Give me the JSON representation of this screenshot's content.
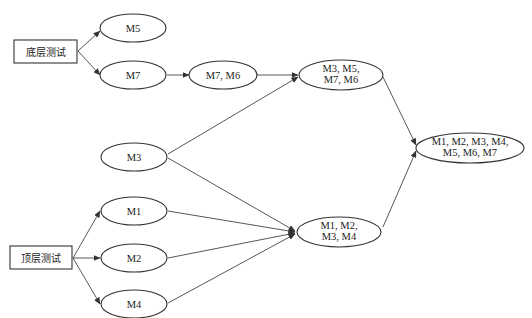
{
  "diagram": {
    "type": "flow-diagram",
    "start_nodes": {
      "bottom_test": "底层测试",
      "top_test": "顶层测试"
    },
    "nodes": {
      "m5": "M5",
      "m7": "M7",
      "m7m6": "M7, M6",
      "m3m5m7m6_line1": "M3, M5,",
      "m3m5m7m6_line2": "M7, M6",
      "m3": "M3",
      "m1": "M1",
      "m2": "M2",
      "m4": "M4",
      "m1m2m3m4_line1": "M1, M2,",
      "m1m2m3m4_line2": "M3, M4",
      "all_line1": "M1, M2, M3, M4,",
      "all_line2": "M5, M6, M7"
    },
    "edges": [
      [
        "底层测试",
        "M5"
      ],
      [
        "底层测试",
        "M7"
      ],
      [
        "M7",
        "M7, M6"
      ],
      [
        "M7, M6",
        "M3, M5, M7, M6"
      ],
      [
        "M3",
        "M3, M5, M7, M6"
      ],
      [
        "M3",
        "M1, M2, M3, M4"
      ],
      [
        "顶层测试",
        "M1"
      ],
      [
        "顶层测试",
        "M2"
      ],
      [
        "顶层测试",
        "M4"
      ],
      [
        "M1",
        "M1, M2, M3, M4"
      ],
      [
        "M2",
        "M1, M2, M3, M4"
      ],
      [
        "M4",
        "M1, M2, M3, M4"
      ],
      [
        "M3, M5, M7, M6",
        "M1, M2, M3, M4, M5, M6, M7"
      ],
      [
        "M1, M2, M3, M4",
        "M1, M2, M3, M4, M5, M6, M7"
      ]
    ],
    "colors": {
      "stroke": "#333333",
      "text": "#222222",
      "background": "#ffffff"
    }
  }
}
